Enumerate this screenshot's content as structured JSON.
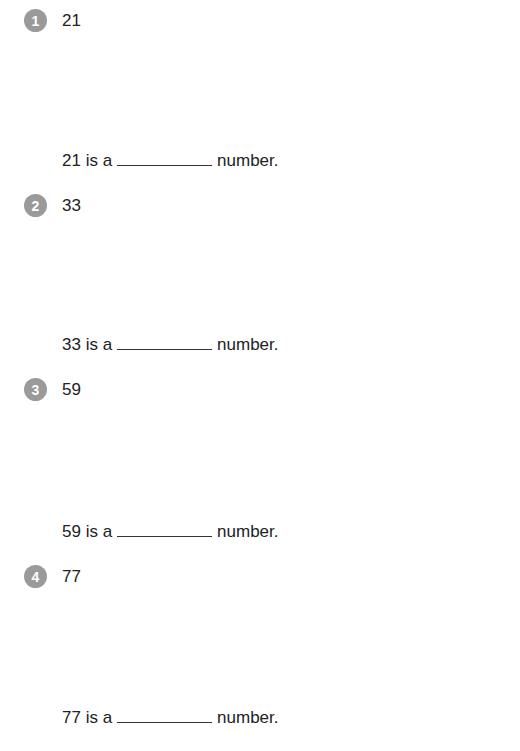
{
  "problems": [
    {
      "index": "1",
      "number": "21",
      "prefix": "21 is a",
      "suffix": "number."
    },
    {
      "index": "2",
      "number": "33",
      "prefix": "33 is a",
      "suffix": "number."
    },
    {
      "index": "3",
      "number": "59",
      "prefix": "59 is a",
      "suffix": "number."
    },
    {
      "index": "4",
      "number": "77",
      "prefix": "77 is a",
      "suffix": "number."
    }
  ]
}
